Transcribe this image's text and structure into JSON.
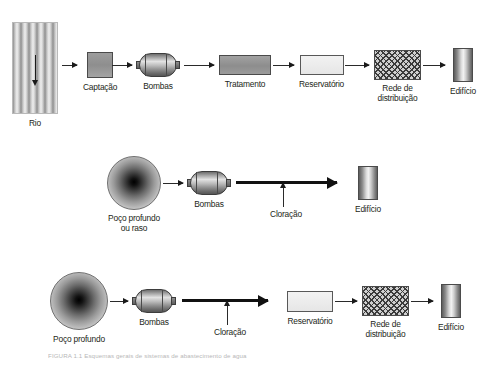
{
  "figure": {
    "caption": "FIGURA 1.1  Esquemas gerais de sistemas de abastecimento de agua"
  },
  "rows": [
    {
      "id": "row-surface-water",
      "nodes": [
        {
          "id": "rio",
          "label": "Rio",
          "shape": "river"
        },
        {
          "id": "captacao",
          "label": "Captação",
          "shape": "gray-square"
        },
        {
          "id": "bombas",
          "label": "Bombas",
          "shape": "pump-cylinder"
        },
        {
          "id": "tratamento",
          "label": "Tratamento",
          "shape": "gray-box"
        },
        {
          "id": "reservatorio",
          "label": "Reservatório",
          "shape": "light-box"
        },
        {
          "id": "rede",
          "label": "Rede de\ndistribuição",
          "shape": "hatched-box"
        },
        {
          "id": "edificio",
          "label": "Edifício",
          "shape": "building"
        }
      ]
    },
    {
      "id": "row-well-direct",
      "nodes": [
        {
          "id": "poco",
          "label": "Poço profundo\nou raso",
          "shape": "well-circle"
        },
        {
          "id": "bombas2",
          "label": "Bombas",
          "shape": "pump-cylinder"
        },
        {
          "id": "cloracao",
          "label": "Cloração",
          "shape": "up-arrow-annotation"
        },
        {
          "id": "edificio2",
          "label": "Edifício",
          "shape": "building"
        }
      ]
    },
    {
      "id": "row-well-network",
      "nodes": [
        {
          "id": "poco3",
          "label": "Poço profundo",
          "shape": "well-circle"
        },
        {
          "id": "bombas3",
          "label": "Bombas",
          "shape": "pump-cylinder"
        },
        {
          "id": "cloracao3",
          "label": "Cloração",
          "shape": "up-arrow-annotation"
        },
        {
          "id": "reservatorio3",
          "label": "Reservatório",
          "shape": "light-box"
        },
        {
          "id": "rede3",
          "label": "Rede de\ndistribuição",
          "shape": "hatched-box"
        },
        {
          "id": "edificio3",
          "label": "Edifício",
          "shape": "building"
        }
      ]
    }
  ],
  "colors": {
    "ink": "#231f20",
    "arrow": "#1a1a1a",
    "box_gray": "#949494",
    "box_light": "#ededed",
    "hatch": "#3b3b3b"
  }
}
